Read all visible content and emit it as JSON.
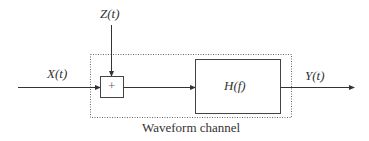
{
  "diagram": {
    "input_label": "X(t)",
    "noise_label": "Z(t)",
    "adder_symbol": "+",
    "filter_label": "H(f)",
    "output_label": "Y(t)",
    "channel_caption": "Waveform channel"
  }
}
